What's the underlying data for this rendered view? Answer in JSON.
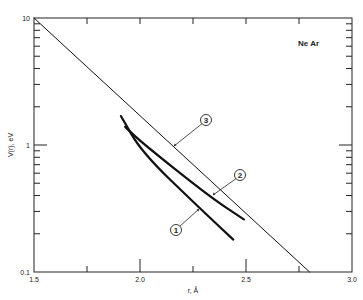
{
  "chart_data": {
    "type": "line",
    "title": "",
    "annotation": "Ne Ar",
    "xlabel": "r, Å",
    "ylabel": "V(r), eV",
    "xlim": [
      1.5,
      3.0
    ],
    "ylim": [
      0.1,
      10
    ],
    "yscale": "log",
    "grid": false,
    "x_ticks": [
      1.5,
      2.0,
      2.5,
      3.0
    ],
    "x_tick_labels": [
      "1.5",
      "2.0",
      "2.5",
      "3.0"
    ],
    "y_ticks": [
      0.1,
      1,
      10
    ],
    "y_tick_labels": [
      "0.1",
      "1",
      "10"
    ],
    "series": [
      {
        "name": "1",
        "label": "1",
        "style": "thick",
        "x": [
          1.91,
          2.01,
          2.28,
          2.44
        ],
        "y": [
          1.69,
          0.87,
          0.32,
          0.18
        ]
      },
      {
        "name": "2",
        "label": "2",
        "style": "thick",
        "x": [
          1.93,
          2.01,
          2.33,
          2.49
        ],
        "y": [
          1.39,
          1.04,
          0.39,
          0.26
        ]
      },
      {
        "name": "3",
        "label": "3",
        "style": "thin",
        "x": [
          1.5,
          2.8
        ],
        "y": [
          10,
          0.1
        ]
      }
    ]
  }
}
